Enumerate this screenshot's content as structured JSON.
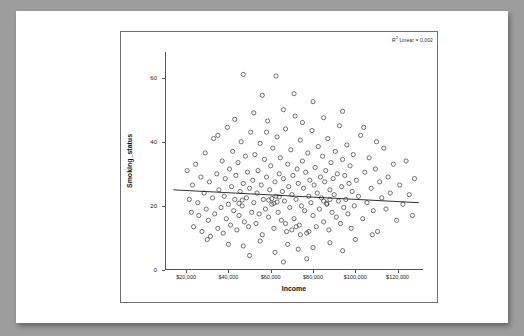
{
  "chart_data": {
    "type": "scatter",
    "title": "",
    "xlabel": "Income",
    "ylabel": "Smoking_status",
    "xlim": [
      10000,
      132000
    ],
    "ylim": [
      0,
      68
    ],
    "grid": false,
    "annotation": "R² Linear = 0.002",
    "annotation_prefix": "R",
    "annotation_sup": "2",
    "annotation_suffix": " Linear = 0.002",
    "xticks": [
      20000,
      40000,
      60000,
      80000,
      100000,
      120000
    ],
    "xtick_labels": [
      "$20,000",
      "$40,000",
      "$60,000",
      "$80,000",
      "$100,000",
      "$120,000"
    ],
    "yticks": [
      0,
      20,
      40,
      60
    ],
    "ytick_labels": [
      "0",
      "20",
      "40",
      "60"
    ],
    "fit_line": {
      "x0": 14000,
      "y0": 25.0,
      "x1": 130000,
      "y1": 21.0
    },
    "points": [
      [
        20500,
        31.0
      ],
      [
        21500,
        22.0
      ],
      [
        22500,
        18.0
      ],
      [
        23000,
        26.5
      ],
      [
        23500,
        13.5
      ],
      [
        24500,
        33.0
      ],
      [
        25500,
        21.0
      ],
      [
        26000,
        17.0
      ],
      [
        27000,
        29.0
      ],
      [
        27500,
        12.0
      ],
      [
        28500,
        24.0
      ],
      [
        29000,
        36.5
      ],
      [
        29500,
        19.0
      ],
      [
        30500,
        15.5
      ],
      [
        31000,
        27.5
      ],
      [
        31500,
        10.5
      ],
      [
        32500,
        22.5
      ],
      [
        33000,
        41.0
      ],
      [
        33500,
        17.5
      ],
      [
        34500,
        30.0
      ],
      [
        35000,
        13.0
      ],
      [
        35500,
        25.0
      ],
      [
        36500,
        19.5
      ],
      [
        37000,
        34.0
      ],
      [
        37500,
        11.5
      ],
      [
        38000,
        23.0
      ],
      [
        38500,
        28.5
      ],
      [
        39000,
        16.0
      ],
      [
        39500,
        44.5
      ],
      [
        40000,
        20.5
      ],
      [
        40500,
        31.5
      ],
      [
        41000,
        14.0
      ],
      [
        41500,
        26.0
      ],
      [
        42000,
        37.0
      ],
      [
        42500,
        18.5
      ],
      [
        43000,
        22.0
      ],
      [
        43500,
        29.5
      ],
      [
        44000,
        12.5
      ],
      [
        44500,
        33.5
      ],
      [
        45000,
        17.0
      ],
      [
        45500,
        24.5
      ],
      [
        46000,
        40.0
      ],
      [
        46500,
        20.0
      ],
      [
        47000,
        27.0
      ],
      [
        47500,
        15.0
      ],
      [
        48000,
        35.5
      ],
      [
        48500,
        22.5
      ],
      [
        49000,
        30.5
      ],
      [
        49500,
        13.5
      ],
      [
        50000,
        25.5
      ],
      [
        50500,
        43.0
      ],
      [
        51000,
        18.0
      ],
      [
        51500,
        28.0
      ],
      [
        52000,
        21.0
      ],
      [
        52500,
        36.0
      ],
      [
        53000,
        14.5
      ],
      [
        53500,
        24.0
      ],
      [
        54000,
        31.0
      ],
      [
        54500,
        17.5
      ],
      [
        55000,
        39.5
      ],
      [
        55500,
        26.5
      ],
      [
        56000,
        11.0
      ],
      [
        56500,
        22.0
      ],
      [
        57000,
        34.5
      ],
      [
        57500,
        19.0
      ],
      [
        58000,
        29.0
      ],
      [
        58500,
        46.5
      ],
      [
        59000,
        16.5
      ],
      [
        59500,
        25.0
      ],
      [
        60000,
        32.5
      ],
      [
        60500,
        20.5
      ],
      [
        61000,
        38.0
      ],
      [
        61500,
        13.0
      ],
      [
        62000,
        27.5
      ],
      [
        62500,
        23.0
      ],
      [
        63000,
        41.5
      ],
      [
        63500,
        18.0
      ],
      [
        64000,
        30.0
      ],
      [
        64500,
        35.0
      ],
      [
        65000,
        15.5
      ],
      [
        65500,
        24.5
      ],
      [
        66000,
        28.5
      ],
      [
        66500,
        21.5
      ],
      [
        67000,
        44.0
      ],
      [
        67500,
        12.0
      ],
      [
        68000,
        33.0
      ],
      [
        68500,
        26.0
      ],
      [
        69000,
        19.5
      ],
      [
        69500,
        37.5
      ],
      [
        70000,
        23.5
      ],
      [
        70500,
        29.5
      ],
      [
        71000,
        16.0
      ],
      [
        71500,
        48.0
      ],
      [
        72000,
        22.0
      ],
      [
        72500,
        31.5
      ],
      [
        73000,
        27.0
      ],
      [
        73500,
        14.0
      ],
      [
        74000,
        40.5
      ],
      [
        74500,
        20.0
      ],
      [
        75000,
        34.0
      ],
      [
        75500,
        25.5
      ],
      [
        76000,
        18.5
      ],
      [
        76500,
        30.5
      ],
      [
        77000,
        11.5
      ],
      [
        77500,
        36.5
      ],
      [
        78000,
        23.0
      ],
      [
        78500,
        28.0
      ],
      [
        79000,
        21.0
      ],
      [
        79500,
        43.5
      ],
      [
        80000,
        17.0
      ],
      [
        80500,
        26.5
      ],
      [
        81000,
        32.0
      ],
      [
        81500,
        13.5
      ],
      [
        82000,
        24.0
      ],
      [
        82500,
        38.5
      ],
      [
        83000,
        19.0
      ],
      [
        83500,
        29.0
      ],
      [
        84000,
        22.5
      ],
      [
        84500,
        35.5
      ],
      [
        85000,
        15.0
      ],
      [
        85500,
        27.5
      ],
      [
        86000,
        31.0
      ],
      [
        86500,
        20.5
      ],
      [
        87000,
        41.0
      ],
      [
        87500,
        12.5
      ],
      [
        88000,
        25.0
      ],
      [
        88500,
        33.5
      ],
      [
        89000,
        18.0
      ],
      [
        89500,
        28.5
      ],
      [
        90000,
        23.5
      ],
      [
        90500,
        37.0
      ],
      [
        91000,
        16.5
      ],
      [
        91500,
        30.0
      ],
      [
        92000,
        21.5
      ],
      [
        92500,
        45.0
      ],
      [
        93000,
        14.5
      ],
      [
        93500,
        26.0
      ],
      [
        94000,
        34.5
      ],
      [
        94500,
        19.5
      ],
      [
        95000,
        29.5
      ],
      [
        95500,
        22.0
      ],
      [
        96000,
        39.0
      ],
      [
        96500,
        17.5
      ],
      [
        97000,
        27.0
      ],
      [
        97500,
        32.5
      ],
      [
        98000,
        13.0
      ],
      [
        98500,
        24.5
      ],
      [
        99000,
        36.0
      ],
      [
        99500,
        20.0
      ],
      [
        100500,
        28.0
      ],
      [
        101500,
        23.0
      ],
      [
        102500,
        42.0
      ],
      [
        103500,
        16.0
      ],
      [
        104500,
        30.5
      ],
      [
        105500,
        21.0
      ],
      [
        106500,
        35.0
      ],
      [
        107500,
        25.5
      ],
      [
        108500,
        18.5
      ],
      [
        109500,
        31.5
      ],
      [
        110500,
        12.0
      ],
      [
        111500,
        27.5
      ],
      [
        112500,
        22.5
      ],
      [
        113500,
        38.0
      ],
      [
        114500,
        19.0
      ],
      [
        115500,
        29.0
      ],
      [
        116500,
        24.0
      ],
      [
        118000,
        33.0
      ],
      [
        119500,
        15.5
      ],
      [
        121000,
        26.5
      ],
      [
        122500,
        20.5
      ],
      [
        124000,
        34.0
      ],
      [
        125500,
        23.5
      ],
      [
        127000,
        17.0
      ],
      [
        128000,
        28.5
      ],
      [
        47000,
        61.0
      ],
      [
        62500,
        60.5
      ],
      [
        56000,
        54.5
      ],
      [
        71000,
        55.0
      ],
      [
        66000,
        50.0
      ],
      [
        52000,
        49.0
      ],
      [
        80000,
        52.5
      ],
      [
        85000,
        47.5
      ],
      [
        94000,
        49.5
      ],
      [
        75000,
        46.0
      ],
      [
        43000,
        47.0
      ],
      [
        58000,
        43.0
      ],
      [
        35000,
        42.0
      ],
      [
        104000,
        44.5
      ],
      [
        110000,
        40.0
      ],
      [
        68000,
        8.0
      ],
      [
        73000,
        6.5
      ],
      [
        62000,
        5.5
      ],
      [
        80000,
        7.0
      ],
      [
        55000,
        9.0
      ],
      [
        88000,
        8.5
      ],
      [
        94000,
        6.0
      ],
      [
        47000,
        7.5
      ],
      [
        50000,
        4.5
      ],
      [
        77000,
        3.5
      ],
      [
        40000,
        8.0
      ],
      [
        100000,
        9.5
      ],
      [
        108000,
        11.0
      ],
      [
        30000,
        9.5
      ],
      [
        66000,
        2.5
      ],
      [
        59000,
        21.8
      ],
      [
        60500,
        22.3
      ],
      [
        61500,
        20.8
      ],
      [
        63000,
        21.2
      ],
      [
        64000,
        22.8
      ],
      [
        85000,
        21.5
      ],
      [
        86500,
        20.8
      ],
      [
        88000,
        22.0
      ],
      [
        45000,
        20.8
      ],
      [
        46500,
        21.8
      ],
      [
        70000,
        12.5
      ],
      [
        72000,
        13.5
      ],
      [
        74000,
        11.0
      ],
      [
        67000,
        14.5
      ],
      [
        78000,
        12.0
      ]
    ]
  }
}
